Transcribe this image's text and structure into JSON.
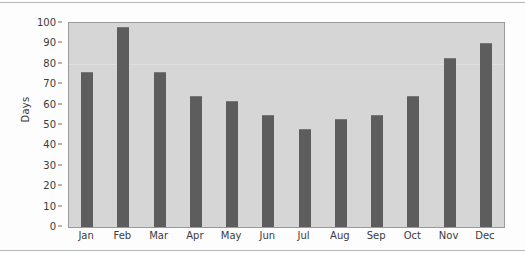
{
  "chart_data": {
    "type": "bar",
    "title": "",
    "subtitle": "",
    "xlabel": "",
    "ylabel": "Days",
    "categories": [
      "Jan",
      "Feb",
      "Mar",
      "Apr",
      "May",
      "Jun",
      "Jul",
      "Aug",
      "Sep",
      "Oct",
      "Nov",
      "Dec"
    ],
    "values": [
      76,
      98,
      76,
      64,
      62,
      55,
      48,
      53,
      55,
      64,
      83,
      90
    ],
    "ylim": [
      0,
      100
    ],
    "ytick_values": [
      0,
      10,
      20,
      30,
      40,
      50,
      60,
      70,
      80,
      90,
      100
    ],
    "ytick_labels": [
      "0",
      "10",
      "20",
      "30",
      "40",
      "50",
      "60",
      "70",
      "80",
      "90",
      "100"
    ],
    "grid": false,
    "legend": null,
    "legend_position": "none",
    "series": [
      {
        "name": "Days",
        "values": [
          76,
          98,
          76,
          64,
          62,
          55,
          48,
          53,
          55,
          64,
          83,
          90
        ]
      }
    ],
    "colors": {
      "bar": "#5d5d5d",
      "plot_background": "#d6d6d6",
      "figure_background": "#fdfdfd",
      "axis": "#9a9a9a",
      "text": "#3b3b3b"
    }
  }
}
